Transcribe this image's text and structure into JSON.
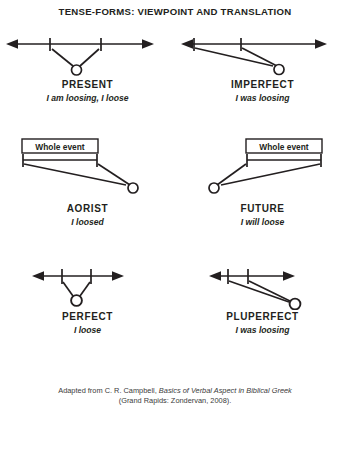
{
  "title": "TENSE-FORMS: VIEWPOINT AND TRANSLATION",
  "box_label": "Whole event",
  "panels": [
    {
      "id": "present",
      "name": "PRESENT",
      "gloss": "I am loosing, I loose",
      "has_whole_event_box": false,
      "viewpoint": "internal",
      "timeline": "full-double-arrow"
    },
    {
      "id": "imperfect",
      "name": "IMPERFECT",
      "gloss": "I was loosing",
      "has_whole_event_box": false,
      "viewpoint": "remote-internal",
      "timeline": "full-double-arrow"
    },
    {
      "id": "aorist",
      "name": "AORIST",
      "gloss": "I loosed",
      "has_whole_event_box": true,
      "viewpoint": "external",
      "timeline": "bracketed-segment"
    },
    {
      "id": "future",
      "name": "FUTURE",
      "gloss": "I will loose",
      "has_whole_event_box": true,
      "viewpoint": "external",
      "timeline": "bracketed-segment"
    },
    {
      "id": "perfect",
      "name": "PERFECT",
      "gloss": "I loose",
      "has_whole_event_box": false,
      "viewpoint": "internal-heightened",
      "timeline": "short-double-arrow"
    },
    {
      "id": "pluperfect",
      "name": "PLUPERFECT",
      "gloss": "I was loosing",
      "has_whole_event_box": false,
      "viewpoint": "remote-internal-heightened",
      "timeline": "short-double-arrow"
    }
  ],
  "footer": {
    "line1_prefix": "Adapted from C. R. Campbell, ",
    "line1_italic": "Basics of Verbal Aspect in Biblical Greek",
    "line2": "(Grand Rapids: Zondervan, 2008)."
  },
  "colors": {
    "ink": "#231f20",
    "background": "#ffffff"
  }
}
